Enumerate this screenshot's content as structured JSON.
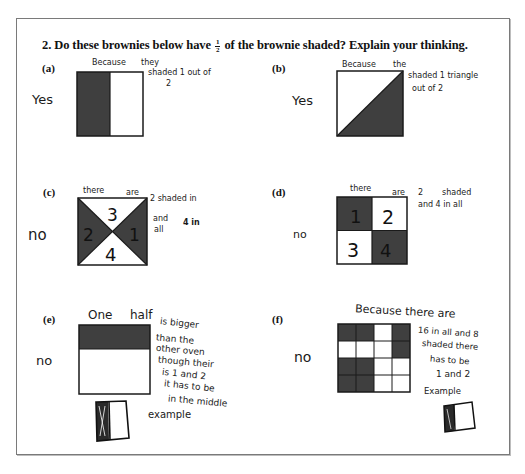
{
  "question": {
    "number": "2.",
    "text_before": "Do these brownies below have",
    "fraction": {
      "numerator": "1",
      "denominator": "2"
    },
    "text_after": "of the brownie shaded? Explain your thinking."
  },
  "items": [
    {
      "label": "(a)",
      "answer": "Yes",
      "explanation_lines": [
        "Because",
        "they",
        "shaded 1 out of",
        "2"
      ],
      "figure": "rectangle split vertically, left half shaded"
    },
    {
      "label": "(b)",
      "answer": "Yes",
      "explanation_lines": [
        "Because",
        "the",
        "shaded 1 triangle",
        "out of 2"
      ],
      "figure": "square split diagonally, lower-right triangle shaded"
    },
    {
      "label": "(c)",
      "answer": "no",
      "explanation_lines": [
        "there",
        "are",
        "2 shaded in",
        "and",
        "4 in",
        "all"
      ],
      "figure": "square split by both diagonals, left and right triangles shaded",
      "region_numbers": [
        "3",
        "2",
        "1",
        "4"
      ]
    },
    {
      "label": "(d)",
      "answer": "no",
      "explanation_lines": [
        "there",
        "are",
        "2",
        "shaded",
        "and 4 in all"
      ],
      "figure": "2x2 grid, top-left and bottom-right shaded",
      "region_numbers": [
        "1",
        "2",
        "3",
        "4"
      ]
    },
    {
      "label": "(e)",
      "answer": "no",
      "explanation_lines": [
        "One",
        "half",
        "is bigger",
        "than the",
        "other oven",
        "though their",
        "is 1 and 2",
        "it has to be",
        "in the middle",
        "example"
      ],
      "figure": "rectangle with top ~third shaded"
    },
    {
      "label": "(f)",
      "answer": "no",
      "explanation_lines": [
        "Because there are",
        "16 in all and 8",
        "shaded there",
        "has to be",
        "1 and 2",
        "Example"
      ],
      "figure": "4x4 grid with 8 cells shaded",
      "grid": [
        [
          1,
          1,
          0,
          1
        ],
        [
          0,
          0,
          0,
          1
        ],
        [
          1,
          1,
          0,
          0
        ],
        [
          1,
          1,
          0,
          0
        ]
      ]
    }
  ],
  "colors": {
    "shade": "#3f3f3f",
    "ink": "#1a1a1a",
    "border": "#7a7a7a"
  }
}
